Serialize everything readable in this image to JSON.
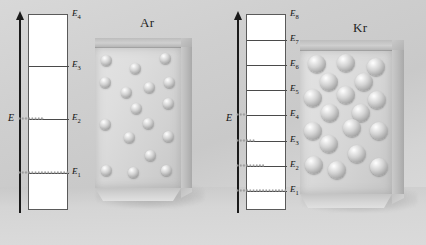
{
  "figure": {
    "background_color": "#d4d4d4"
  },
  "panels": [
    {
      "id": "argon",
      "element_label": "Ar",
      "axis_label": "E",
      "axis_name": "energy-axis",
      "level_count": 4,
      "level_spacing_note": "widely spaced levels",
      "levels": [
        {
          "label": "E",
          "sub": "4",
          "y": 14,
          "population_fraction": 0.0
        },
        {
          "label": "E",
          "sub": "3",
          "y": 65,
          "population_fraction": 0.0
        },
        {
          "label": "E",
          "sub": "2",
          "y": 118,
          "population_fraction": 0.42
        },
        {
          "label": "E",
          "sub": "1",
          "y": 172,
          "population_fraction": 1.0
        }
      ],
      "particle_count": 17,
      "particle_size": "small",
      "particles": [
        [
          0.14,
          0.1
        ],
        [
          0.47,
          0.16
        ],
        [
          0.83,
          0.09
        ],
        [
          0.13,
          0.26
        ],
        [
          0.37,
          0.33
        ],
        [
          0.64,
          0.29
        ],
        [
          0.87,
          0.26
        ],
        [
          0.86,
          0.41
        ],
        [
          0.49,
          0.44
        ],
        [
          0.12,
          0.56
        ],
        [
          0.63,
          0.55
        ],
        [
          0.4,
          0.65
        ],
        [
          0.86,
          0.64
        ],
        [
          0.65,
          0.78
        ],
        [
          0.14,
          0.88
        ],
        [
          0.45,
          0.9
        ],
        [
          0.84,
          0.88
        ]
      ]
    },
    {
      "id": "krypton",
      "element_label": "Kr",
      "axis_label": "E",
      "axis_name": "energy-axis",
      "level_count": 8,
      "level_spacing_note": "closely spaced levels",
      "levels": [
        {
          "label": "E",
          "sub": "8",
          "y": 14,
          "population_fraction": 0.0
        },
        {
          "label": "E",
          "sub": "7",
          "y": 39,
          "population_fraction": 0.0
        },
        {
          "label": "E",
          "sub": "6",
          "y": 64,
          "population_fraction": 0.0
        },
        {
          "label": "E",
          "sub": "5",
          "y": 89,
          "population_fraction": 0.0
        },
        {
          "label": "E",
          "sub": "4",
          "y": 114,
          "population_fraction": 0.14
        },
        {
          "label": "E",
          "sub": "3",
          "y": 140,
          "population_fraction": 0.33
        },
        {
          "label": "E",
          "sub": "2",
          "y": 165,
          "population_fraction": 0.52
        },
        {
          "label": "E",
          "sub": "1",
          "y": 190,
          "population_fraction": 1.0
        }
      ],
      "particle_count": 18,
      "particle_size": "large",
      "particles": [
        [
          0.17,
          0.09
        ],
        [
          0.5,
          0.08
        ],
        [
          0.83,
          0.11
        ],
        [
          0.32,
          0.22
        ],
        [
          0.7,
          0.22
        ],
        [
          0.14,
          0.33
        ],
        [
          0.5,
          0.31
        ],
        [
          0.84,
          0.35
        ],
        [
          0.33,
          0.44
        ],
        [
          0.14,
          0.56
        ],
        [
          0.56,
          0.54
        ],
        [
          0.86,
          0.56
        ],
        [
          0.31,
          0.65
        ],
        [
          0.62,
          0.72
        ],
        [
          0.15,
          0.8
        ],
        [
          0.4,
          0.83
        ],
        [
          0.86,
          0.81
        ],
        [
          0.66,
          0.44
        ]
      ]
    }
  ]
}
